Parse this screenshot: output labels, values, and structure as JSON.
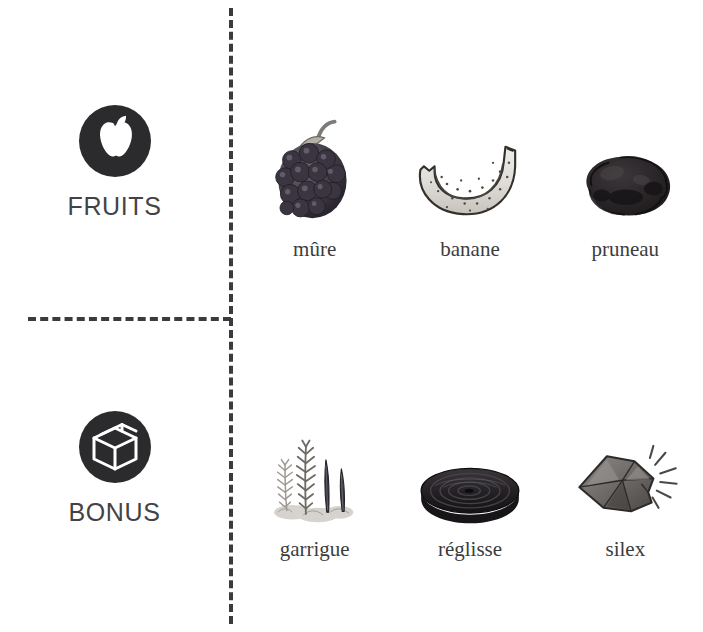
{
  "page": {
    "background_color": "#ffffff",
    "divider_color": "#3b3b3f",
    "text_color": "#3c3c40"
  },
  "categories": [
    {
      "id": "fruits",
      "label": "FRUITS",
      "icon": "apple-in-circle-icon",
      "items": [
        {
          "label": "mûre",
          "art": "blackberry-illustration"
        },
        {
          "label": "banane",
          "art": "banana-illustration"
        },
        {
          "label": "pruneau",
          "art": "prune-illustration"
        }
      ]
    },
    {
      "id": "bonus",
      "label": "BONUS",
      "icon": "box-in-circle-icon",
      "items": [
        {
          "label": "garrigue",
          "art": "garrigue-herbs-illustration"
        },
        {
          "label": "réglisse",
          "art": "licorice-wheel-illustration"
        },
        {
          "label": "silex",
          "art": "flint-stone-illustration"
        }
      ]
    }
  ]
}
